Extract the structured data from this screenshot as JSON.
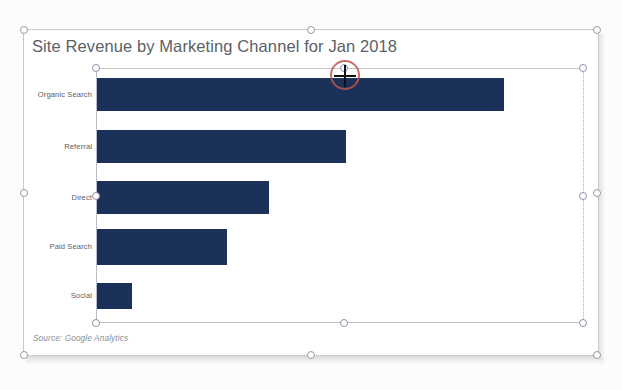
{
  "app": {
    "object_type": "chart-object",
    "selection_state": "plot-area-selected",
    "cursor": "move-crosshair"
  },
  "chart_data": {
    "type": "bar",
    "orientation": "horizontal",
    "title": "Site Revenue by Marketing Channel for Jan 2018",
    "xlabel": "",
    "ylabel": "",
    "categories": [
      "Organic Search",
      "Referral",
      "Direct",
      "Paid Search",
      "Social"
    ],
    "values": [
      407,
      249,
      172,
      130,
      35
    ],
    "value_unit": "pixels-of-bar-length",
    "series": [
      {
        "name": "Site Revenue",
        "values": [
          407,
          249,
          172,
          130,
          35
        ]
      }
    ],
    "xlim": [
      0,
      488
    ],
    "grid": false,
    "legend": "none",
    "bar_color": "#1b3159",
    "annotations": [
      "Source: Google Analytics"
    ]
  },
  "chart": {
    "title": "Site Revenue by Marketing Channel for Jan 2018",
    "source_note": "Source: Google Analytics",
    "title_color": "#5c5f66",
    "bar_color": "#1b3159",
    "axis_color": "#c3c3c3"
  },
  "categories": [
    {
      "label": "Organic Search",
      "bar_length": 407,
      "top": 78,
      "height": 33
    },
    {
      "label": "Referral",
      "bar_length": 249,
      "top": 130,
      "height": 33
    },
    {
      "label": "Direct",
      "bar_length": 172,
      "top": 181,
      "height": 33
    },
    {
      "label": "Paid Search",
      "bar_length": 130,
      "top": 229,
      "height": 36
    },
    {
      "label": "Social",
      "bar_length": 35,
      "top": 283,
      "height": 26
    }
  ],
  "handles": {
    "outer": [
      {
        "name": "handle-top-left",
        "x": 24,
        "y": 30
      },
      {
        "name": "handle-top-center",
        "x": 311,
        "y": 30
      },
      {
        "name": "handle-top-right",
        "x": 597,
        "y": 30
      },
      {
        "name": "handle-middle-left",
        "x": 24,
        "y": 193
      },
      {
        "name": "handle-middle-right",
        "x": 597,
        "y": 193
      },
      {
        "name": "handle-bottom-left",
        "x": 24,
        "y": 355
      },
      {
        "name": "handle-bottom-center",
        "x": 311,
        "y": 355
      },
      {
        "name": "handle-bottom-right",
        "x": 597,
        "y": 355
      }
    ],
    "inner": [
      {
        "name": "plot-handle-top-left",
        "x": 96,
        "y": 68
      },
      {
        "name": "plot-handle-top-center",
        "x": 344,
        "y": 68
      },
      {
        "name": "plot-handle-top-right",
        "x": 583,
        "y": 68
      },
      {
        "name": "plot-handle-middle-left",
        "x": 96,
        "y": 196
      },
      {
        "name": "plot-handle-middle-right",
        "x": 583,
        "y": 196
      },
      {
        "name": "plot-handle-bottom-left",
        "x": 96,
        "y": 323
      },
      {
        "name": "plot-handle-bottom-center",
        "x": 344,
        "y": 323
      },
      {
        "name": "plot-handle-bottom-right",
        "x": 583,
        "y": 323
      }
    ]
  },
  "cursor": {
    "x": 345,
    "y": 75,
    "ring_color": "#c0564a"
  }
}
